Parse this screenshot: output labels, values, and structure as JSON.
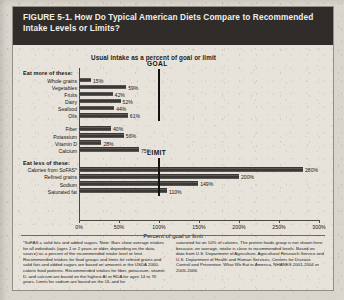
{
  "figure": {
    "title": "FIGURE 5-1. How Do Typical American Diets Compare to Recommended Intake Levels or Limits?",
    "subhead": "Usual intake as a percent of goal or limit"
  },
  "chart_data": {
    "type": "bar",
    "orientation": "horizontal",
    "title": "Usual intake as a percent of goal or limit",
    "xlabel": "Percent of goal or limit",
    "ylabel": "",
    "xlim": [
      0,
      300
    ],
    "xticks": [
      0,
      50,
      100,
      150,
      200,
      250,
      300
    ],
    "xtick_labels": [
      "0%",
      "50%",
      "100%",
      "150%",
      "200%",
      "250%",
      "300%"
    ],
    "grid": false,
    "legend": "none",
    "groups": [
      {
        "name": "eat-more",
        "header": "Eat more of these:",
        "reference_label": "GOAL",
        "reference_value": 100,
        "categories": [
          "Whole grains",
          "Vegetables",
          "Fruits",
          "Dairy",
          "Seafood",
          "Oils"
        ],
        "values": [
          15,
          59,
          42,
          52,
          44,
          61
        ],
        "value_labels": [
          "15%",
          "59%",
          "42%",
          "52%",
          "44%",
          "61%"
        ]
      },
      {
        "name": "eat-more-nutrients",
        "header": "",
        "categories": [
          "Fiber",
          "Potassium",
          "Vitamin D",
          "Calcium"
        ],
        "values": [
          40,
          56,
          28,
          75
        ],
        "value_labels": [
          "40%",
          "56%",
          "28%",
          "75%"
        ]
      },
      {
        "name": "eat-less",
        "header": "Eat less of these:",
        "reference_label": "LIMIT",
        "reference_value": 100,
        "categories": [
          "Calories from SoFAS*",
          "Refined grains",
          "Sodium",
          "Saturated fat"
        ],
        "values": [
          280,
          200,
          149,
          110
        ],
        "value_labels": [
          "280%",
          "200%",
          "149%",
          "110%"
        ]
      }
    ]
  },
  "footnotes": {
    "left": "*SoFAS = solid fats and added sugars.\nNote: Bars show average intakes for all individuals (ages 1 or 2 years or older, depending on the data source) as a percent of the recommended intake level or limit. Recommended intakes for food groups and limits for refined grains and solid fats and added sugars are based on amounts in the USDA 2000-calorie food patterns. Recommended intakes for fiber, potassium, vitamin D, and calcium are based on the highest AI or RDA for ages 14 to 70 years. Limits for sodium are based on the UL and for",
    "right": "saturated fat on 10% of calories. The protein foods group is not shown here because, on average, intake is close to recommended levels.\n\nBased on data from U.S. Department of Agriculture, Agricultural Research Service and U.S. Department of Health and Human Services, Centers for Disease Control and Prevention. What We Eat in America, NHANES 2001-2004 or 2005-2006."
  }
}
